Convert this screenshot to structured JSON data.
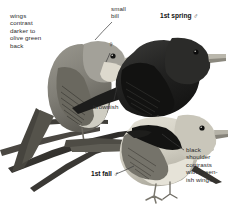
{
  "plate": {
    "width": 228,
    "height": 208,
    "background": "#ffffff",
    "style": "grayscale field-guide illustration"
  },
  "annotations": [
    {
      "id": "wings-contrast",
      "text": "wings\ncontrast\ndarker to\nolive green\nback",
      "bold": false,
      "x": 10,
      "y": 12
    },
    {
      "id": "small-bill",
      "text": "small\nbill",
      "bold": false,
      "x": 111,
      "y": 5
    },
    {
      "id": "first-spring-male",
      "text": "1st spring ♂",
      "bold": true,
      "x": 160,
      "y": 12
    },
    {
      "id": "female-symbol",
      "text": "♀",
      "bold": false,
      "x": 108,
      "y": 44
    },
    {
      "id": "brownish",
      "text": "brownish",
      "bold": false,
      "x": 93,
      "y": 104
    },
    {
      "id": "first-fall-male",
      "text": "1st fall ♂",
      "bold": true,
      "x": 91,
      "y": 171
    },
    {
      "id": "black-shoulder",
      "text": "black\nshoulder\ncontrasts\nwith green-\nish wings",
      "bold": false,
      "x": 185,
      "y": 146
    }
  ],
  "birds": [
    {
      "id": "female-olive",
      "label": "♀",
      "description": "pale olive-grey bird perched facing right, upper left"
    },
    {
      "id": "first-spring-male",
      "label": "1st spring ♂",
      "description": "dark blackish bird facing right, upper right"
    },
    {
      "id": "first-fall-male",
      "label": "1st fall ♂",
      "description": "pale bird with black shoulder patch, lower right"
    }
  ],
  "colors": {
    "ink": "#2b2b2b",
    "bold_ink": "#111111",
    "leader": "#3a3a3a",
    "dark_plumage": "#262626",
    "mid_plumage": "#7e7e78",
    "pale_plumage": "#d7d4c9",
    "branch": "#3c3a36"
  }
}
